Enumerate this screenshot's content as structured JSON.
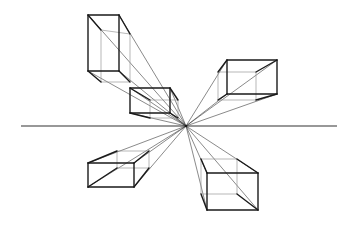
{
  "figure": {
    "width": 356,
    "height": 226,
    "background": "#ffffff",
    "line_color": "#1a1a1a",
    "horizon_line": {
      "x1": 21,
      "x2": 337,
      "y": 126
    },
    "vanishing_point": {
      "x": 186,
      "y": 126
    },
    "boxes": [
      {
        "name": "top-left-box",
        "front": [
          [
            88,
            15
          ],
          [
            119,
            15
          ],
          [
            119,
            71
          ],
          [
            88,
            71
          ]
        ],
        "back": [
          [
            101,
            30
          ],
          [
            130,
            34
          ],
          [
            130,
            82
          ],
          [
            101,
            82
          ]
        ]
      },
      {
        "name": "center-left-box",
        "front": [
          [
            130,
            88
          ],
          [
            170,
            88
          ],
          [
            170,
            113
          ],
          [
            130,
            113
          ]
        ],
        "back": [
          [
            150,
            100
          ],
          [
            178,
            100
          ],
          [
            178,
            118
          ],
          [
            150,
            118
          ]
        ]
      },
      {
        "name": "top-right-box",
        "front": [
          [
            227,
            60
          ],
          [
            277,
            60
          ],
          [
            277,
            94
          ],
          [
            227,
            94
          ]
        ],
        "back": [
          [
            218,
            72
          ],
          [
            256,
            72
          ],
          [
            256,
            100
          ],
          [
            218,
            100
          ]
        ]
      },
      {
        "name": "bottom-left-box",
        "front": [
          [
            88,
            163
          ],
          [
            134,
            163
          ],
          [
            134,
            187
          ],
          [
            88,
            187
          ]
        ],
        "back": [
          [
            117,
            151
          ],
          [
            149,
            151
          ],
          [
            149,
            168
          ],
          [
            117,
            168
          ]
        ]
      },
      {
        "name": "bottom-right-box",
        "front": [
          [
            207,
            173
          ],
          [
            258,
            173
          ],
          [
            258,
            210
          ],
          [
            207,
            210
          ]
        ],
        "back": [
          [
            201,
            159
          ],
          [
            237,
            159
          ],
          [
            237,
            194
          ],
          [
            201,
            194
          ]
        ]
      }
    ]
  }
}
